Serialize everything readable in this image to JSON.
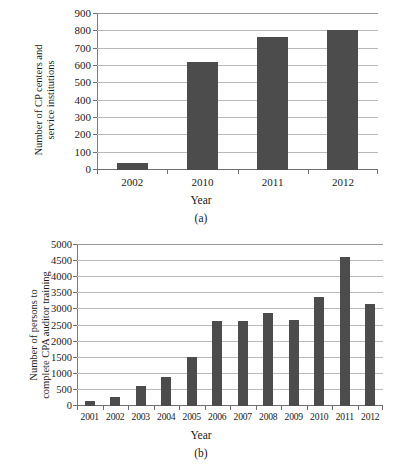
{
  "chart_data": [
    {
      "id": "a",
      "type": "bar",
      "title": "",
      "caption": "(a)",
      "xlabel": "Year",
      "ylabel_lines": [
        "Number of CP centers and",
        "service institutions"
      ],
      "ylabel": "Number of CP centers and service institutions",
      "categories": [
        "2002",
        "2010",
        "2011",
        "2012"
      ],
      "values": [
        40,
        625,
        770,
        805
      ],
      "yticks": [
        0,
        100,
        200,
        300,
        400,
        500,
        600,
        700,
        800,
        900
      ],
      "ytick_labels": [
        "0",
        "100",
        "200",
        "300",
        "400",
        "500",
        "600",
        "700",
        "800",
        "900"
      ],
      "ylim": [
        0,
        900
      ],
      "grid": true,
      "legend": "none",
      "bar_color": "#4c4c4c",
      "gridline_color": "#b9b9b9",
      "axis_color": "#6f6f6f"
    },
    {
      "id": "b",
      "type": "bar",
      "title": "",
      "caption": "(b)",
      "xlabel": "Year",
      "ylabel_lines": [
        "Number of  persons to",
        "complete CPA auditor training"
      ],
      "ylabel": "Number of  persons to complete CPA auditor training",
      "categories": [
        "2001",
        "2002",
        "2003",
        "2004",
        "2005",
        "2006",
        "2007",
        "2008",
        "2009",
        "2010",
        "2011",
        "2012"
      ],
      "values": [
        150,
        290,
        620,
        900,
        1530,
        2630,
        2640,
        2900,
        2670,
        3390,
        4640,
        3180
      ],
      "yticks": [
        0,
        500,
        1000,
        1500,
        2000,
        2500,
        3000,
        3500,
        4000,
        4500,
        5000
      ],
      "ytick_labels": [
        "0",
        "500",
        "1000",
        "1500",
        "2000",
        "2500",
        "3000",
        "3500",
        "4000",
        "4500",
        "5000"
      ],
      "ylim": [
        0,
        5000
      ],
      "grid": true,
      "legend": "none",
      "bar_color": "#4c4c4c",
      "gridline_color": "#b9b9b9",
      "axis_color": "#6f6f6f"
    }
  ]
}
